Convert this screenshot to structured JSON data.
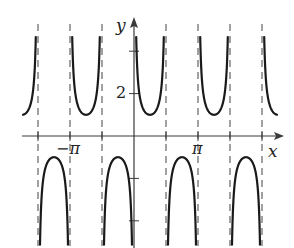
{
  "chart_data": {
    "type": "line",
    "title": "",
    "function": "y = csc(2x)",
    "xlabel": "x",
    "ylabel": "y",
    "x_tick_labels": [
      {
        "value": "-pi",
        "label": "−π"
      },
      {
        "value": "pi",
        "label": "π"
      }
    ],
    "y_tick_labels": [
      {
        "value": 2,
        "label": "2"
      }
    ],
    "x_ticks_multiples_of_pi_over_2": [
      -3,
      -2,
      -1,
      1,
      2,
      3,
      4
    ],
    "y_ticks": [
      4,
      2,
      -2,
      -4
    ],
    "asymptotes_multiples_of_pi_over_2": [
      -3,
      -2,
      -1,
      0,
      1,
      2,
      3,
      4
    ],
    "period": "pi",
    "local_min_value": 1,
    "local_max_value": -1,
    "xlim_pi_units": [
      -1.75,
      2.3
    ],
    "ylim": [
      -5.2,
      5.2
    ],
    "grid": false,
    "legend": null
  },
  "layout": {
    "origin_px": [
      134,
      136
    ],
    "px_per_pi": 64,
    "px_per_unit_y": 21.2,
    "curve_color": "#1a1a1a",
    "asymptote_color": "#8a8a8a",
    "axis_color": "#3a3a3a"
  },
  "labels": {
    "x_axis": "x",
    "y_axis": "y",
    "neg_pi": "−π",
    "pi": "π",
    "two": "2"
  }
}
